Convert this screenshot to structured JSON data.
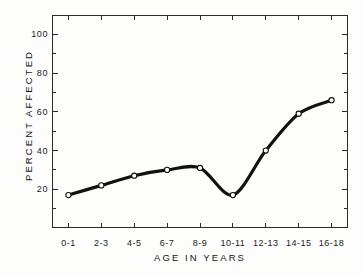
{
  "chart_data": {
    "type": "line",
    "title": "",
    "xlabel": "AGE IN YEARS",
    "ylabel": "PERCENT AFFECTED",
    "categories": [
      "0-1",
      "2-3",
      "4-5",
      "6-7",
      "8-9",
      "10-11",
      "12-13",
      "14-15",
      "16-18"
    ],
    "values": [
      17,
      22,
      27,
      30,
      31,
      17,
      40,
      59,
      66
    ],
    "series": [
      {
        "name": "Percent affected",
        "values": [
          17,
          22,
          27,
          30,
          31,
          17,
          40,
          59,
          66
        ]
      }
    ],
    "ylim": [
      0,
      110
    ],
    "xlim": [
      0,
      9
    ],
    "y_major_ticks": [
      20,
      40,
      60,
      80,
      100
    ],
    "y_major_tick_labels": [
      "20",
      "40",
      "60",
      "80",
      "100"
    ],
    "y_minor_ticks": [
      10,
      30,
      50,
      70,
      90,
      110
    ],
    "grid": false,
    "legend": false,
    "legend_position": "none",
    "marker": "open-circle",
    "line_color": "#111111",
    "marker_face_color": "#ffffff",
    "marker_edge_color": "#111111",
    "frame_color": "#2a2a2a",
    "background_color": "#fdfdfc",
    "smoothing": "spline"
  }
}
